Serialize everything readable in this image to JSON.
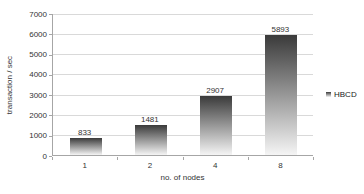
{
  "chart_data": {
    "type": "bar",
    "categories": [
      "1",
      "2",
      "4",
      "8"
    ],
    "values": [
      833,
      1481,
      2907,
      5893
    ],
    "title": "",
    "xlabel": "no. of nodes",
    "ylabel": "transaction / sec",
    "ylim": [
      0,
      7000
    ],
    "ytick_step": 1000,
    "ytick_labels": [
      "0",
      "1000",
      "2000",
      "3000",
      "4000",
      "5000",
      "6000",
      "7000"
    ],
    "grid": "horizontal",
    "data_labels_shown": true,
    "legend": {
      "position": "right",
      "entries": [
        {
          "label": "HBCD",
          "marker": "square-gradient"
        }
      ]
    },
    "colors": {
      "bar_gradient_top": "#3a3a3a",
      "bar_gradient_bottom": "#f5f5f5",
      "gridline": "#d9d9d9",
      "axis_line": "#a6a6a6",
      "text": "#333333",
      "background": "#ffffff"
    }
  }
}
